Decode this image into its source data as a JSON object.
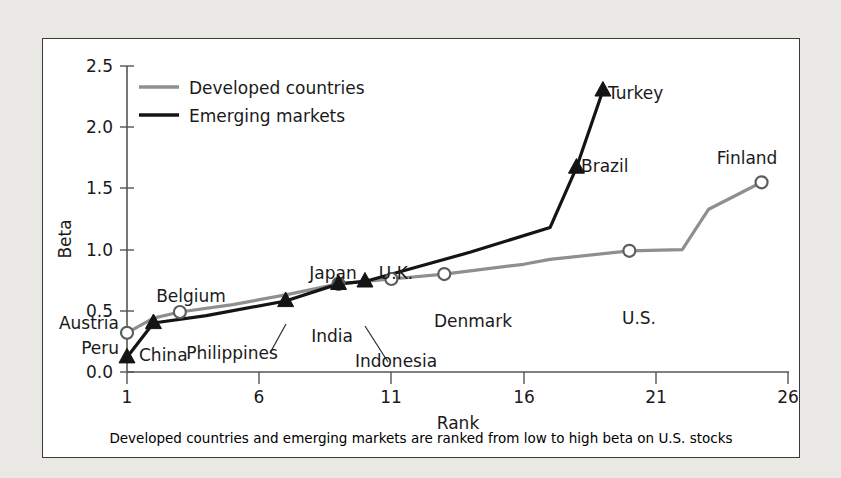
{
  "chart_data": {
    "type": "line",
    "title": "",
    "xlabel": "Rank",
    "ylabel": "Beta",
    "xlim": [
      1,
      26
    ],
    "ylim": [
      0.0,
      2.5
    ],
    "xticks": [
      1,
      6,
      11,
      16,
      21,
      26
    ],
    "yticks": [
      "0.0",
      "0.5",
      "1.0",
      "1.5",
      "2.0",
      "2.5"
    ],
    "grid": false,
    "legend_position": "top-left-inside",
    "caption": "Developed countries and emerging markets are ranked from low to high beta on U.S. stocks",
    "series": [
      {
        "name": "Developed countries",
        "color": "#8f8f8f",
        "marker": "open-circle",
        "x": [
          1,
          2,
          3,
          5,
          7,
          9,
          11,
          13,
          16,
          17,
          20,
          22,
          23,
          25
        ],
        "values": [
          0.32,
          0.44,
          0.49,
          0.55,
          0.63,
          0.72,
          0.76,
          0.8,
          0.88,
          0.92,
          0.99,
          1.0,
          1.33,
          1.55
        ]
      },
      {
        "name": "Emerging markets",
        "color": "#141414",
        "marker": "filled-triangle",
        "x": [
          1,
          2,
          4,
          7,
          9,
          10,
          12,
          14,
          17,
          18,
          19
        ],
        "values": [
          0.12,
          0.4,
          0.46,
          0.58,
          0.72,
          0.74,
          0.86,
          0.98,
          1.18,
          1.67,
          2.3
        ]
      }
    ],
    "annotations": [
      {
        "label": "Austria",
        "series": "Developed countries",
        "rank": 1,
        "beta": 0.32,
        "marker": "open-circle"
      },
      {
        "label": "Peru",
        "series": "Emerging markets",
        "rank": 1,
        "beta": 0.12,
        "marker": "filled-triangle"
      },
      {
        "label": "China",
        "series": "Emerging markets",
        "rank": 2,
        "beta": 0.4,
        "marker": "filled-triangle"
      },
      {
        "label": "Belgium",
        "series": "Developed countries",
        "rank": 3,
        "beta": 0.49,
        "marker": "open-circle"
      },
      {
        "label": "Philippines",
        "series": "Emerging markets",
        "rank": 7,
        "beta": 0.58,
        "marker": "filled-triangle"
      },
      {
        "label": "Japan",
        "series": "Developed countries",
        "rank": 9,
        "beta": 0.72,
        "marker": "open-circle"
      },
      {
        "label": "India",
        "series": "Emerging markets",
        "rank": 9,
        "beta": 0.72,
        "marker": "filled-triangle"
      },
      {
        "label": "Indonesia",
        "series": "Emerging markets",
        "rank": 10,
        "beta": 0.74,
        "marker": "filled-triangle"
      },
      {
        "label": "U.K.",
        "series": "Developed countries",
        "rank": 11,
        "beta": 0.76,
        "marker": "open-circle"
      },
      {
        "label": "Denmark",
        "series": "Developed countries",
        "rank": 13,
        "beta": 0.8,
        "marker": "open-circle"
      },
      {
        "label": "Brazil",
        "series": "Emerging markets",
        "rank": 18,
        "beta": 1.67,
        "marker": "filled-triangle"
      },
      {
        "label": "Turkey",
        "series": "Emerging markets",
        "rank": 19,
        "beta": 2.3,
        "marker": "filled-triangle"
      },
      {
        "label": "U.S.",
        "series": "Developed countries",
        "rank": 20,
        "beta": 0.99,
        "marker": "open-circle"
      },
      {
        "label": "Finland",
        "series": "Developed countries",
        "rank": 25,
        "beta": 1.55,
        "marker": "open-circle"
      }
    ]
  },
  "legend": {
    "items": [
      {
        "label": "Developed countries",
        "color": "#8f8f8f"
      },
      {
        "label": "Emerging markets",
        "color": "#141414"
      }
    ]
  },
  "axes": {
    "y_title": "Beta",
    "x_title": "Rank",
    "y_tick_labels": [
      "2.5",
      "2.0",
      "1.5",
      "1.0",
      "0.5",
      "0.0"
    ],
    "x_tick_labels": [
      "1",
      "6",
      "11",
      "16",
      "21",
      "26"
    ]
  },
  "labels": {
    "austria": "Austria",
    "peru": "Peru",
    "china": "China",
    "belgium": "Belgium",
    "philippines": "Philippines",
    "japan": "Japan",
    "india": "India",
    "indonesia": "Indonesia",
    "uk": "U.K.",
    "denmark": "Denmark",
    "brazil": "Brazil",
    "turkey": "Turkey",
    "us": "U.S.",
    "finland": "Finland"
  },
  "caption": "Developed countries and emerging markets are ranked from low to high beta on U.S. stocks"
}
